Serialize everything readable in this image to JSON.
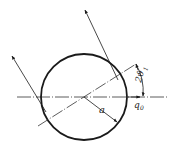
{
  "diagram": {
    "title": "",
    "elements": {
      "circle": {
        "cx": 84,
        "cy": 97,
        "r": 43
      },
      "horizontal_axis": {
        "x1": 17,
        "y1": 97,
        "x2": 167,
        "y2": 97
      },
      "inclined_axis": {
        "x1": 38,
        "y1": 126,
        "x2": 136,
        "y2": 64
      },
      "ray_upper": {
        "x1": 118,
        "y1": 80,
        "x2": 85,
        "y2": 10
      },
      "ray_left": {
        "x1": 46,
        "y1": 112,
        "x2": 12,
        "y2": 56
      },
      "radius_line": {
        "x1": 84,
        "y1": 97,
        "x2": 117,
        "y2": 122
      }
    },
    "labels": {
      "radius": "a",
      "angle": "2ϑ",
      "angle_sub": "1",
      "incident": "q",
      "incident_sub": "0"
    },
    "colors": {
      "stroke": "#1a1a1a",
      "background": "#ffffff"
    }
  }
}
